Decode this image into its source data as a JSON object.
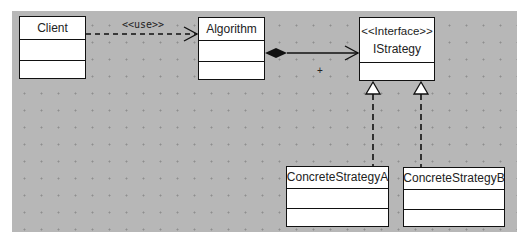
{
  "diagram": {
    "type": "UML class diagram",
    "pattern": "Strategy",
    "classes": [
      {
        "id": "client",
        "name": "Client",
        "stereotype": null
      },
      {
        "id": "algorithm",
        "name": "Algorithm",
        "stereotype": null
      },
      {
        "id": "istrategy",
        "name": "IStrategy",
        "stereotype": "<<Interface>>"
      },
      {
        "id": "concrete-a",
        "name": "ConcreteStrategyA",
        "stereotype": null
      },
      {
        "id": "concrete-b",
        "name": "ConcreteStrategyB",
        "stereotype": null
      }
    ],
    "relations": [
      {
        "from": "Client",
        "to": "Algorithm",
        "kind": "dependency",
        "label": "<<use>>"
      },
      {
        "from": "Algorithm",
        "to": "IStrategy",
        "kind": "composition",
        "label": ""
      },
      {
        "from": "ConcreteStrategyA",
        "to": "IStrategy",
        "kind": "realization",
        "label": ""
      },
      {
        "from": "ConcreteStrategyB",
        "to": "IStrategy",
        "kind": "realization",
        "label": ""
      }
    ],
    "cursor_glyph": "+"
  },
  "colors": {
    "canvas": "#b7b7b7",
    "box_fill": "#ffffff",
    "stroke": "#111111"
  }
}
